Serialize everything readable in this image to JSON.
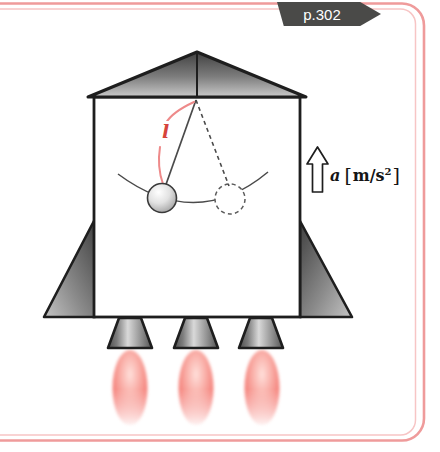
{
  "badge": {
    "label": "p.302"
  },
  "figure": {
    "length_label": "l",
    "accel_symbol": "a",
    "unit_open": "[",
    "unit_main": "m/s",
    "unit_sup": "2",
    "unit_close": "]"
  },
  "colors": {
    "border_outer": "#ef9b9b",
    "border_inner": "#f7c5c5",
    "badge_bg": "#4a4a48",
    "badge_text": "#ffffff",
    "label_red": "#d6443c",
    "arc_red": "#ee8a8a",
    "ink": "#1e1e1e",
    "flame_red": "#f2665f"
  }
}
